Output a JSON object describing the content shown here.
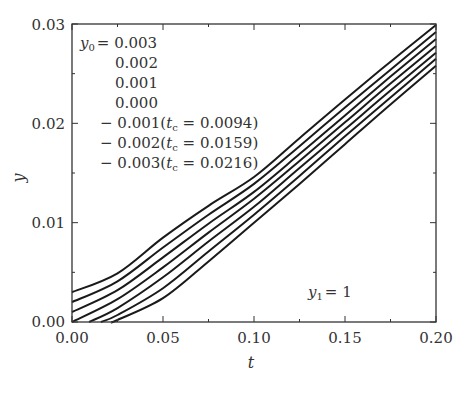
{
  "chart_data": {
    "type": "line",
    "title": "",
    "xlabel": "t",
    "ylabel": "y",
    "xlim": [
      0,
      0.2
    ],
    "ylim": [
      0,
      0.03
    ],
    "x_ticks": [
      "0.00",
      "0.05",
      "0.10",
      "0.15",
      "0.20"
    ],
    "y_ticks": [
      "0.00",
      "0.01",
      "0.02",
      "0.03"
    ],
    "grid": false,
    "annotation": "y1 = 1",
    "legend_position": "upper left",
    "legend": [
      "y0 = 0.003",
      "0.002",
      "0.001",
      "0.000",
      "-0.001 (tc = 0.0094)",
      "-0.002 (tc = 0.0159)",
      "-0.003 (tc = 0.0216)"
    ],
    "x": [
      0.0,
      0.025,
      0.05,
      0.075,
      0.1,
      0.125,
      0.15,
      0.175,
      0.2
    ],
    "series": [
      {
        "name": "y0=0.003",
        "y0": 0.003,
        "tc": null,
        "points": [
          [
            0,
            0.003
          ],
          [
            0.025,
            0.0049
          ],
          [
            0.05,
            0.0085
          ],
          [
            0.075,
            0.0117
          ],
          [
            0.1,
            0.0146
          ],
          [
            0.125,
            0.0185
          ],
          [
            0.15,
            0.0224
          ],
          [
            0.175,
            0.0262
          ],
          [
            0.2,
            0.0299
          ]
        ]
      },
      {
        "name": "y0=0.002",
        "y0": 0.002,
        "tc": null,
        "points": [
          [
            0,
            0.002
          ],
          [
            0.025,
            0.0041
          ],
          [
            0.05,
            0.0075
          ],
          [
            0.075,
            0.0108
          ],
          [
            0.1,
            0.0139
          ],
          [
            0.125,
            0.0177
          ],
          [
            0.15,
            0.0216
          ],
          [
            0.175,
            0.0254
          ],
          [
            0.2,
            0.0292
          ]
        ]
      },
      {
        "name": "y0=0.001",
        "y0": 0.001,
        "tc": null,
        "points": [
          [
            0,
            0.001
          ],
          [
            0.025,
            0.0032
          ],
          [
            0.05,
            0.0065
          ],
          [
            0.075,
            0.0099
          ],
          [
            0.1,
            0.0131
          ],
          [
            0.125,
            0.0169
          ],
          [
            0.15,
            0.0208
          ],
          [
            0.175,
            0.0247
          ],
          [
            0.2,
            0.0285
          ]
        ]
      },
      {
        "name": "y0=0.000",
        "y0": 0.0,
        "tc": null,
        "points": [
          [
            0,
            0.0
          ],
          [
            0.025,
            0.0023
          ],
          [
            0.05,
            0.0055
          ],
          [
            0.075,
            0.009
          ],
          [
            0.1,
            0.0124
          ],
          [
            0.125,
            0.0162
          ],
          [
            0.15,
            0.0201
          ],
          [
            0.175,
            0.024
          ],
          [
            0.2,
            0.0278
          ]
        ]
      },
      {
        "name": "y0=-0.001",
        "y0": -0.001,
        "tc": 0.0094,
        "points": [
          [
            0.0094,
            0.0
          ],
          [
            0.025,
            0.0014
          ],
          [
            0.05,
            0.0045
          ],
          [
            0.075,
            0.0081
          ],
          [
            0.1,
            0.0116
          ],
          [
            0.125,
            0.0155
          ],
          [
            0.15,
            0.0194
          ],
          [
            0.175,
            0.0233
          ],
          [
            0.2,
            0.0271
          ]
        ]
      },
      {
        "name": "y0=-0.002",
        "y0": -0.002,
        "tc": 0.0159,
        "points": [
          [
            0.0159,
            0.0
          ],
          [
            0.025,
            0.0007
          ],
          [
            0.05,
            0.0034
          ],
          [
            0.075,
            0.0071
          ],
          [
            0.1,
            0.0108
          ],
          [
            0.125,
            0.0147
          ],
          [
            0.15,
            0.0187
          ],
          [
            0.175,
            0.0226
          ],
          [
            0.2,
            0.0265
          ]
        ]
      },
      {
        "name": "y0=-0.003",
        "y0": -0.003,
        "tc": 0.0216,
        "points": [
          [
            0.0216,
            0.0
          ],
          [
            0.025,
            0.0002
          ],
          [
            0.05,
            0.0024
          ],
          [
            0.075,
            0.0061
          ],
          [
            0.1,
            0.01
          ],
          [
            0.125,
            0.0139
          ],
          [
            0.15,
            0.0179
          ],
          [
            0.175,
            0.0219
          ],
          [
            0.2,
            0.0258
          ]
        ]
      }
    ]
  },
  "labels": {
    "xlabel": "t",
    "ylabel": "y",
    "annotation_var": "y",
    "annotation_sub": "1",
    "annotation_val": "= 1",
    "legend_var": "y",
    "legend_sub": "0",
    "legend_eq": "= 0.003",
    "legend_rows": [
      "0.002",
      "0.001",
      "0.000"
    ],
    "legend_tc_rows": [
      {
        "y0": "− 0.001(",
        "tc": "0.0094)"
      },
      {
        "y0": "− 0.002(",
        "tc": "0.0159)"
      },
      {
        "y0": "− 0.003(",
        "tc": "0.0216)"
      }
    ],
    "tc_var": "t",
    "tc_sub": "c",
    "x_ticks": [
      "0.00",
      "0.05",
      "0.10",
      "0.15",
      "0.20"
    ],
    "y_ticks": [
      "0.00",
      "0.01",
      "0.02",
      "0.03"
    ]
  },
  "style": {
    "line_color": "#1a1a1a",
    "axis_color": "#333333"
  }
}
